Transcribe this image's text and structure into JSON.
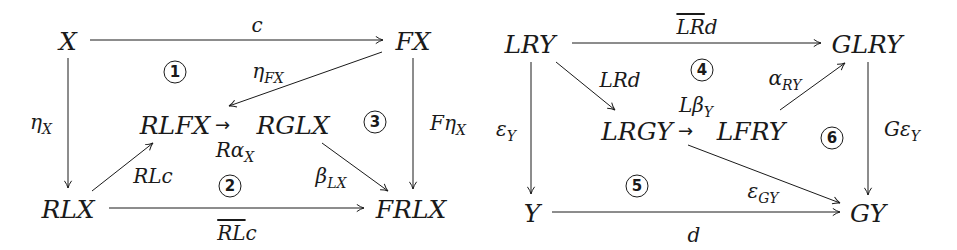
{
  "diagrams": [
    {
      "id": "left",
      "nodes": {
        "X": "X",
        "FX": "FX",
        "RLFX": "RLFX",
        "RGLX": "RGLX",
        "RLX": "RLX",
        "FRLX": "FRLX"
      },
      "arrows": {
        "top": {
          "from": "X",
          "to": "FX",
          "label": "c"
        },
        "diag_FX_RLFX": {
          "from": "FX",
          "to": "RLFX",
          "label_base": "η",
          "label_sub": "FX"
        },
        "left": {
          "from": "X",
          "to": "RLX",
          "label_base": "η",
          "label_sub": "X"
        },
        "middle": {
          "from": "RLFX",
          "to": "RGLX",
          "glyph": "→",
          "label_base": "Rα",
          "label_sub": "X"
        },
        "right": {
          "from": "FX",
          "to": "FRLX",
          "label_base": "Fη",
          "label_sub": "X"
        },
        "diag_RLX_RLFX": {
          "from": "RLX",
          "to": "RLFX",
          "label": "RLc"
        },
        "diag_RGLX_FRLX": {
          "from": "RGLX",
          "to": "FRLX",
          "label_base": "β",
          "label_sub": "LX"
        },
        "bottom": {
          "from": "RLX",
          "to": "FRLX",
          "label_overlined": "RL",
          "label_rest": "c"
        }
      },
      "regions": [
        "1",
        "2",
        "3"
      ]
    },
    {
      "id": "right",
      "nodes": {
        "LRY": "LRY",
        "GLRY": "GLRY",
        "LRGY": "LRGY",
        "LFRY": "LFRY",
        "Y": "Y",
        "GY": "GY"
      },
      "arrows": {
        "top": {
          "from": "LRY",
          "to": "GLRY",
          "label_overlined": "LR",
          "label_rest": "d"
        },
        "diag_LRY_LRGY": {
          "from": "LRY",
          "to": "LRGY",
          "label": "LRd"
        },
        "diag_LFRY_GLRY": {
          "from": "LFRY",
          "to": "GLRY",
          "label_base": "α",
          "label_sub": "RY"
        },
        "middle": {
          "from": "LRGY",
          "to": "LFRY",
          "glyph": "→",
          "label_base": "Lβ",
          "label_sub": "Y"
        },
        "left": {
          "from": "LRY",
          "to": "Y",
          "label_base": "ε",
          "label_sub": "Y"
        },
        "right": {
          "from": "GLRY",
          "to": "GY",
          "label_base": "Gε",
          "label_sub": "Y"
        },
        "diag_LRGY_GY": {
          "from": "LRGY",
          "to": "GY",
          "label_base": "ε",
          "label_sub": "GY"
        },
        "bottom": {
          "from": "Y",
          "to": "GY",
          "label": "d"
        }
      },
      "regions": [
        "4",
        "5",
        "6"
      ]
    }
  ]
}
